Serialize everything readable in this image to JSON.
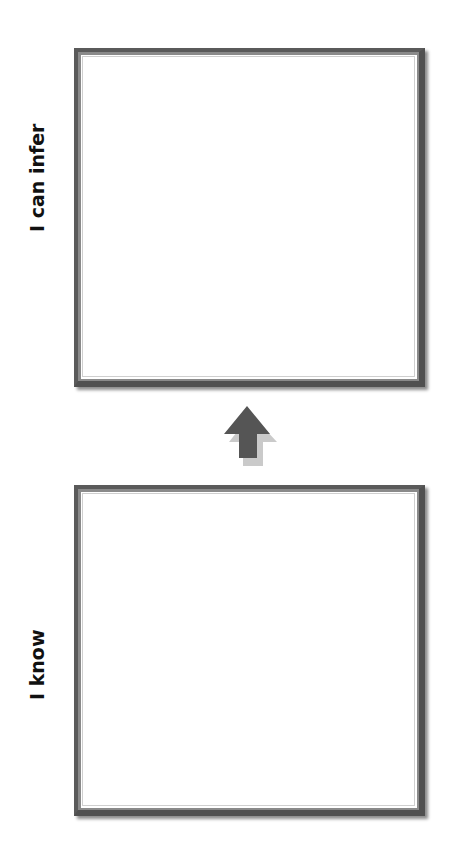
{
  "diagram": {
    "top_box": {
      "label": "I can infer",
      "content": ""
    },
    "bottom_box": {
      "label": "I know",
      "content": ""
    },
    "arrow": {
      "icon": "up-arrow-icon",
      "direction": "up",
      "color": "#555555"
    }
  }
}
